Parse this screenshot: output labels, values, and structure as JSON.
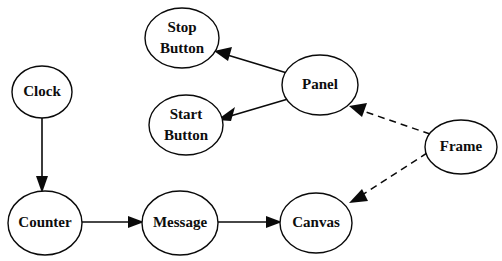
{
  "diagram": {
    "background_color": "#ffffff",
    "stroke_color": "#0a0a0a",
    "text_color": "#0d0d0d",
    "width": 502,
    "height": 261,
    "nodes": [
      {
        "id": "clock",
        "label": "Clock",
        "label_lines": [
          "Clock"
        ],
        "cx": 42,
        "cy": 92,
        "rx": 30,
        "ry": 26
      },
      {
        "id": "stop_button",
        "label": "Stop Button",
        "label_lines": [
          "Stop",
          "Button"
        ],
        "cx": 182,
        "cy": 38,
        "rx": 37,
        "ry": 30
      },
      {
        "id": "start_button",
        "label": "Start Button",
        "label_lines": [
          "Start",
          "Button"
        ],
        "cx": 186,
        "cy": 125,
        "rx": 37,
        "ry": 30
      },
      {
        "id": "panel",
        "label": "Panel",
        "label_lines": [
          "Panel"
        ],
        "cx": 320,
        "cy": 85,
        "rx": 38,
        "ry": 30
      },
      {
        "id": "frame",
        "label": "Frame",
        "label_lines": [
          "Frame"
        ],
        "cx": 461,
        "cy": 147,
        "rx": 36,
        "ry": 27
      },
      {
        "id": "counter",
        "label": "Counter",
        "label_lines": [
          "Counter"
        ],
        "cx": 45,
        "cy": 223,
        "rx": 37,
        "ry": 32
      },
      {
        "id": "message",
        "label": "Message",
        "label_lines": [
          "Message"
        ],
        "cx": 180,
        "cy": 223,
        "rx": 38,
        "ry": 32
      },
      {
        "id": "canvas",
        "label": "Canvas",
        "label_lines": [
          "Canvas"
        ],
        "cx": 316,
        "cy": 223,
        "rx": 36,
        "ry": 30
      }
    ],
    "edges": [
      {
        "id": "clock-to-counter",
        "from": "clock",
        "to": "counter",
        "style": "solid",
        "arrow": "end",
        "x1": 42,
        "y1": 118,
        "x2": 42,
        "y2": 191
      },
      {
        "id": "counter-to-message",
        "from": "counter",
        "to": "message",
        "style": "solid",
        "arrow": "end",
        "x1": 82,
        "y1": 222,
        "x2": 142,
        "y2": 222
      },
      {
        "id": "message-to-canvas",
        "from": "message",
        "to": "canvas",
        "style": "solid",
        "arrow": "end",
        "x1": 218,
        "y1": 222,
        "x2": 280,
        "y2": 222
      },
      {
        "id": "panel-to-stop-button",
        "from": "panel",
        "to": "stop_button",
        "style": "solid",
        "arrow": "end",
        "x1": 287,
        "y1": 72,
        "x2": 216,
        "y2": 51
      },
      {
        "id": "panel-to-start-button",
        "from": "panel",
        "to": "start_button",
        "style": "solid",
        "arrow": "end",
        "x1": 288,
        "y1": 99,
        "x2": 219,
        "y2": 120
      },
      {
        "id": "frame-to-panel",
        "from": "frame",
        "to": "panel",
        "style": "dashed",
        "arrow": "end",
        "x1": 430,
        "y1": 134,
        "x2": 350,
        "y2": 106
      },
      {
        "id": "frame-to-canvas",
        "from": "frame",
        "to": "canvas",
        "style": "dashed",
        "arrow": "end",
        "x1": 427,
        "y1": 153,
        "x2": 350,
        "y2": 203
      }
    ]
  }
}
